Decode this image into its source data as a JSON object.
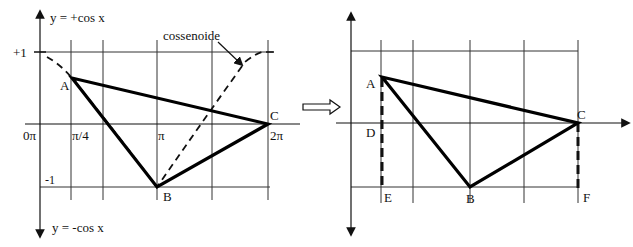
{
  "left_graph": {
    "top_axis_label": "y = +cos x",
    "bottom_axis_label": "y = -cos x",
    "curve_label": "cossenoide",
    "y_ticks": {
      "plus_one": "+1",
      "minus_one": "-1"
    },
    "x_ticks": [
      "0π",
      "π/4",
      "π",
      "2π"
    ],
    "points": {
      "A": "A",
      "B": "B",
      "C": "C"
    }
  },
  "transition_arrow": "⇒",
  "right_graph": {
    "points": {
      "A": "A",
      "B": "B",
      "C": "C",
      "D": "D",
      "E": "E",
      "F": "F"
    }
  },
  "colors": {
    "line": "#111111",
    "grid": "#333333",
    "background": "#ffffff"
  }
}
